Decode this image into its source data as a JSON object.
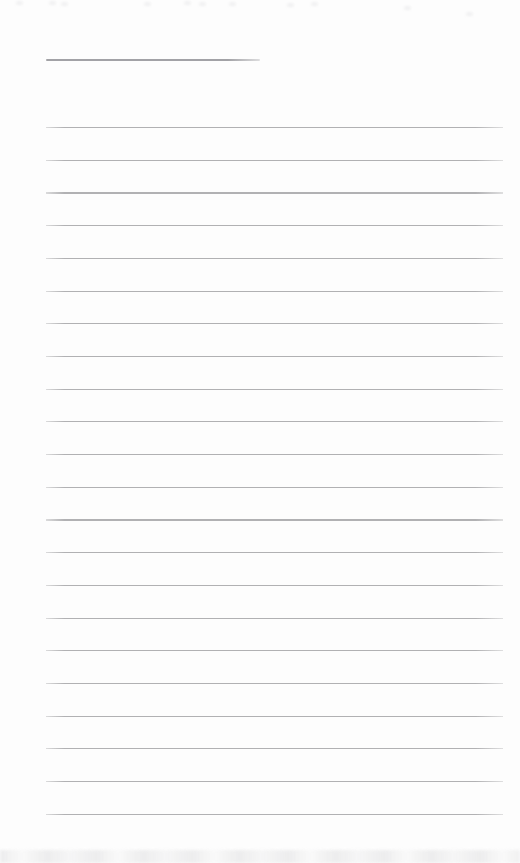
{
  "document": {
    "kind": "scanned blank lined page",
    "background_color": "#fdfdfd",
    "name_line": {
      "x": 46,
      "y": 59,
      "width": 214,
      "thickness": 2,
      "color": "#a2a2a6"
    },
    "ruled_lines": {
      "count": 22,
      "x": 46,
      "width": 457,
      "first_y": 127,
      "spacing": 32.7,
      "thickness": 1.2,
      "color": "#b1b1b3"
    },
    "top_artifact_specks": [
      {
        "x": 16,
        "y": 1
      },
      {
        "x": 49,
        "y": 1
      },
      {
        "x": 61,
        "y": 2
      },
      {
        "x": 144,
        "y": 2
      },
      {
        "x": 184,
        "y": 1
      },
      {
        "x": 199,
        "y": 2
      },
      {
        "x": 229,
        "y": 2
      },
      {
        "x": 287,
        "y": 3
      },
      {
        "x": 311,
        "y": 2
      },
      {
        "x": 404,
        "y": 6
      },
      {
        "x": 466,
        "y": 12
      }
    ],
    "bottom_artifact": {
      "y": 850,
      "height": 13,
      "color": "#eaeaeb"
    }
  }
}
